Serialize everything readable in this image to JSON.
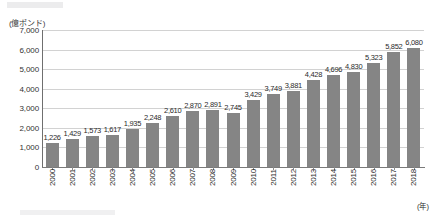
{
  "chart_data": {
    "type": "bar",
    "title": "",
    "subtitle": "",
    "xlabel": "(年)",
    "ylabel": "(億ポンド)",
    "unit_caption": "(億ポンド)",
    "xaxis_unit": "(年)",
    "ylim": [
      0,
      7000
    ],
    "ytick_step": 1000,
    "grid": true,
    "legend": false,
    "legend_position": "none",
    "bar_color": "#858585",
    "categories": [
      "2000",
      "2001",
      "2002",
      "2003",
      "2004",
      "2005",
      "2006",
      "2007",
      "2008",
      "2009",
      "2010",
      "2011",
      "2012",
      "2013",
      "2014",
      "2015",
      "2016",
      "2017",
      "2018"
    ],
    "values": [
      1226,
      1429,
      1573,
      1617,
      1935,
      2248,
      2610,
      2870,
      2891,
      2745,
      3429,
      3749,
      3881,
      4428,
      4696,
      4830,
      5323,
      5852,
      6080
    ],
    "value_labels": [
      "1,226",
      "1,429",
      "1,573",
      "1,617",
      "1,935",
      "2,248",
      "2,610",
      "2,870",
      "2,891",
      "2,745",
      "3,429",
      "3,749",
      "3,881",
      "4,428",
      "4,696",
      "4,830",
      "5,323",
      "5,852",
      "6,080"
    ],
    "ytick_labels": [
      "7,000",
      "6,000",
      "5,000",
      "4,000",
      "3,000",
      "2,000",
      "1,000",
      "0"
    ],
    "ytick_values": [
      7000,
      6000,
      5000,
      4000,
      3000,
      2000,
      1000,
      0
    ]
  }
}
